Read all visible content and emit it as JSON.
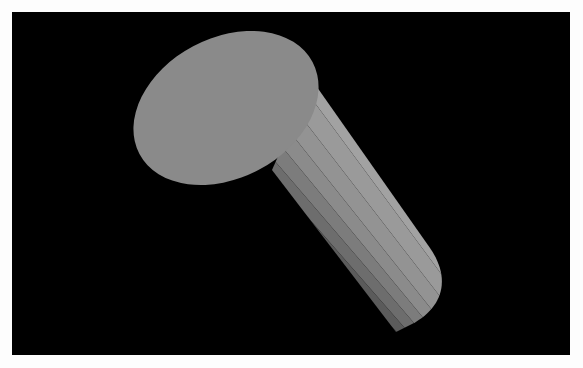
{
  "figure": {
    "background_color": "#000000",
    "object": "shaded-cylinder",
    "cap_color": "#8a8a8a",
    "band_colors": [
      "#9e9e9e",
      "#949494",
      "#8a8a8a",
      "#7e7e7e",
      "#717171",
      "#646464",
      "#565656",
      "#494949"
    ]
  },
  "caption": {
    "text": ""
  }
}
